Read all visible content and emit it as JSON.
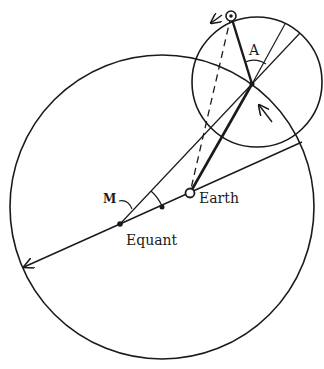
{
  "diagram": {
    "type": "equant-epicycle model",
    "colors": {
      "ink": "#1a1a1a",
      "background": "#ffffff"
    },
    "labels": {
      "angle_a": "A",
      "angle_m": "M",
      "earth": "Earth",
      "equant": "Equant"
    },
    "points": {
      "deferent_center": [
        162,
        207
      ],
      "earth": [
        190,
        193
      ],
      "equant": [
        120,
        224
      ],
      "epicycle_center": [
        252,
        84
      ],
      "planet": [
        231,
        16
      ]
    },
    "circles": {
      "deferent": {
        "cx": 162,
        "cy": 207,
        "r": 152
      },
      "epicycle": {
        "cx": 257,
        "cy": 82,
        "r": 65
      }
    }
  }
}
